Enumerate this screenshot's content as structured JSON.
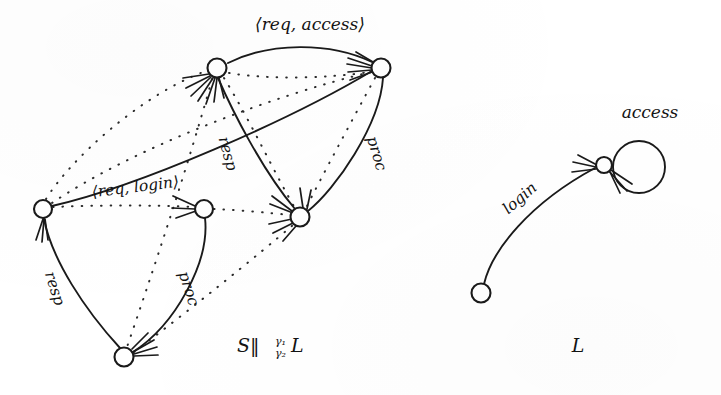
{
  "figure": {
    "background_color": "#ffffff",
    "ink_color": "#1a1a1a",
    "width": 721,
    "height": 395
  },
  "left_system": {
    "caption": "S‖",
    "caption_gamma_top": "γ₁",
    "caption_gamma_bottom": "γ₂",
    "caption_tail": "L",
    "caption_full": "S‖γ₁γ₂ L",
    "nodes": [
      {
        "id": "n-top-left",
        "cx": 217,
        "cy": 68,
        "r": 9.5
      },
      {
        "id": "n-top-right",
        "cx": 381,
        "cy": 68,
        "r": 9.5
      },
      {
        "id": "n-left",
        "cx": 43,
        "cy": 209,
        "r": 9.0
      },
      {
        "id": "n-middle",
        "cx": 204,
        "cy": 209,
        "r": 9.0
      },
      {
        "id": "n-right-mid",
        "cx": 300,
        "cy": 217,
        "r": 9.5
      },
      {
        "id": "n-bottom",
        "cx": 124,
        "cy": 357,
        "r": 9.5
      }
    ],
    "edge_labels": [
      {
        "id": "req-access",
        "text": "⟨req, access⟩",
        "x": 310,
        "y": 30,
        "rotate": 0
      },
      {
        "id": "req-login",
        "text": "⟨req, login⟩",
        "x": 136,
        "y": 192,
        "rotate": -7
      },
      {
        "id": "resp-upper",
        "text": "resp",
        "x": 223,
        "y": 155,
        "rotate": 75
      },
      {
        "id": "proc-right",
        "text": "proc",
        "x": 372,
        "y": 155,
        "rotate": 73
      },
      {
        "id": "resp-lower",
        "text": "resp",
        "x": 50,
        "y": 290,
        "rotate": 72
      },
      {
        "id": "proc-lower",
        "text": "proc",
        "x": 184,
        "y": 290,
        "rotate": 72
      }
    ]
  },
  "right_system": {
    "caption": "L",
    "nodes": [
      {
        "id": "r-start",
        "cx": 481,
        "cy": 293,
        "r": 9.5
      },
      {
        "id": "r-acc",
        "cx": 604,
        "cy": 165,
        "r": 8.0
      }
    ],
    "self_loop": {
      "cx": 639,
      "cy": 167,
      "r": 26
    },
    "edge_labels": [
      {
        "id": "login",
        "text": "login",
        "x": 523,
        "y": 202,
        "rotate": -41
      },
      {
        "id": "access",
        "text": "access",
        "x": 650,
        "y": 118,
        "rotate": 0
      }
    ]
  }
}
